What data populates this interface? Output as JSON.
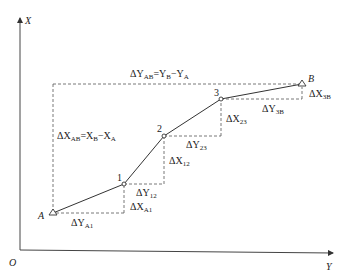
{
  "axes": {
    "x_label": "X",
    "y_label": "Y",
    "origin_label": "O"
  },
  "points": [
    {
      "id": "A",
      "label": "A",
      "type": "triangle"
    },
    {
      "id": "1",
      "label": "1",
      "type": "circle"
    },
    {
      "id": "2",
      "label": "2",
      "type": "circle"
    },
    {
      "id": "3",
      "label": "3",
      "type": "circle"
    },
    {
      "id": "B",
      "label": "B",
      "type": "triangle"
    }
  ],
  "labels": {
    "dY_AB": {
      "prefix": "ΔY",
      "sub": "AB",
      "rest": "=Y",
      "sub2": "B",
      "rest2": "−Y",
      "sub3": "A"
    },
    "dX_AB": {
      "prefix": "ΔX",
      "sub": "AB",
      "rest": "=X",
      "sub2": "B",
      "rest2": "−X",
      "sub3": "A"
    },
    "dY_A1": {
      "prefix": "ΔY",
      "sub": "A1"
    },
    "dX_A1": {
      "prefix": "ΔX",
      "sub": "A1"
    },
    "dY_12": {
      "prefix": "ΔY",
      "sub": "12"
    },
    "dX_12": {
      "prefix": "ΔX",
      "sub": "12"
    },
    "dY_23": {
      "prefix": "ΔY",
      "sub": "23"
    },
    "dX_23": {
      "prefix": "ΔX",
      "sub": "23"
    },
    "dY_3B": {
      "prefix": "ΔY",
      "sub": "3B"
    },
    "dX_3B": {
      "prefix": "ΔX",
      "sub": "3B"
    }
  }
}
